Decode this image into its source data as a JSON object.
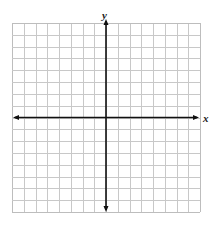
{
  "header_fragment": "",
  "chart_data": {
    "type": "scatter",
    "title": "",
    "xlabel": "x",
    "ylabel": "y",
    "xlim": [
      -8,
      8
    ],
    "ylim": [
      -8,
      8
    ],
    "grid": true,
    "grid_cells": {
      "columns": 16,
      "rows": 16
    },
    "axes_arrows": true,
    "tick_labels": [],
    "series": [],
    "legend": null
  },
  "colors": {
    "grid": "#c8c8c8",
    "grid_border": "#bdbdbd",
    "axis": "#111111"
  },
  "layout": {
    "grid_left": 12,
    "grid_top": 23,
    "grid_right": 200,
    "grid_bottom": 212
  }
}
